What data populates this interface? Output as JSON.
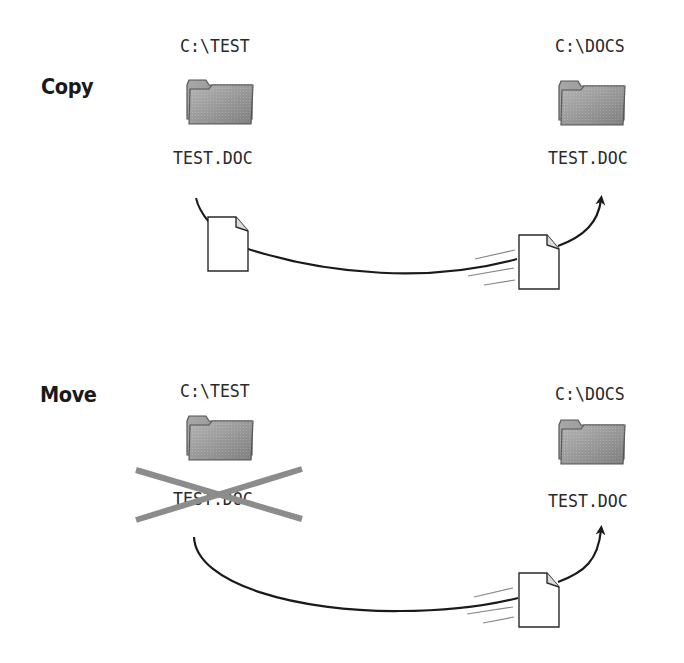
{
  "copy": {
    "label": "Copy",
    "source": {
      "path": "C:\\TEST",
      "file": "TEST.DOC"
    },
    "destination": {
      "path": "C:\\DOCS",
      "file": "TEST.DOC"
    }
  },
  "move": {
    "label": "Move",
    "source": {
      "path": "C:\\TEST",
      "file": "TEST.DOC",
      "file_crossed_out": true
    },
    "destination": {
      "path": "C:\\DOCS",
      "file": "TEST.DOC"
    }
  },
  "icons": {
    "folder": "folder-icon",
    "document": "document-icon",
    "arrow": "curved-arrow",
    "cross": "cross-out-mark"
  },
  "colors": {
    "text": "#2a2a2a",
    "folder_fill": "#9a9a9a",
    "folder_edge": "#555555",
    "cross": "#8c8c8c",
    "line": "#1a1a1a"
  }
}
